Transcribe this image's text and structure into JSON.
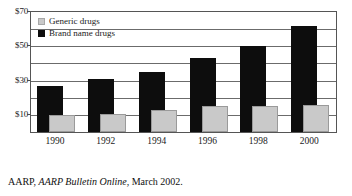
{
  "chart_data": {
    "type": "bar",
    "title": "",
    "subtitle": "",
    "xlabel": "",
    "ylabel": "",
    "categories": [
      "1990",
      "1992",
      "1994",
      "1996",
      "1998",
      "2000"
    ],
    "series": [
      {
        "name": "Brand name drugs",
        "color": "#0d0d0d",
        "values": [
          27,
          31,
          35,
          43,
          50,
          62
        ]
      },
      {
        "name": "Generic drugs",
        "color": "#c9c9c9",
        "values": [
          10,
          10.5,
          13,
          15,
          15,
          16
        ]
      }
    ],
    "ylim": [
      0,
      70
    ],
    "y_ticks": [
      10,
      30,
      50,
      70
    ],
    "y_tick_labels": [
      "$10",
      "$30",
      "$50",
      "$70"
    ],
    "gridlines": [
      10,
      20,
      30,
      40,
      50,
      60,
      70
    ],
    "grid": true,
    "legend_position": "top-left",
    "bar_style": "overlapped",
    "value_prefix": "$"
  },
  "legend": {
    "items": [
      {
        "label": "Generic drugs",
        "swatch": "generic-swatch"
      },
      {
        "label": "Brand name drugs",
        "swatch": "brand-swatch"
      }
    ]
  },
  "caption": {
    "org": "AARP,",
    "publication": "AARP Bulletin Online",
    "date": ", March 2002."
  }
}
